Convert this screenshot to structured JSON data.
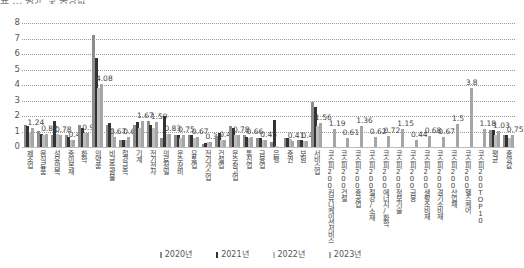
{
  "chart_data": {
    "type": "bar",
    "title": "",
    "xlabel": "",
    "ylabel": "",
    "ylim": [
      0,
      8
    ],
    "yticks": [
      0,
      1,
      2,
      3,
      4,
      5,
      6,
      7,
      8
    ],
    "grid": true,
    "legend_position": "bottom",
    "categories": [
      "제조업",
      "음식료품",
      "섬유의복",
      "종이목재",
      "화학",
      "의약품",
      "비금속광물",
      "철강금속",
      "기계",
      "전기전자",
      "의료정밀",
      "운수장비",
      "유통업",
      "전기가스업",
      "건설업",
      "운수창고업",
      "통신업",
      "금융업",
      "은행",
      "증권",
      "보험",
      "서비스업",
      "코스피200커뮤니케이션서비스",
      "코스피200건설",
      "코스피200중공업",
      "코스피200철강/소재",
      "코스피200에너지/화학",
      "코스피200정보기술",
      "코스피200금융",
      "코스피200생활소비재",
      "코스피200경기소비재",
      "코스피200산업재",
      "코스피200헬스케어",
      "코스피200TOP10",
      "평균",
      "중앙값"
    ],
    "series": [
      {
        "name": "2020년",
        "color": "#8c8c8c",
        "values": [
          1.45,
          1.05,
          0.75,
          0.75,
          1.45,
          7.2,
          1.45,
          0.45,
          1.45,
          1.7,
          0.6,
          0.75,
          0.75,
          0.2,
          0.7,
          1.35,
          0.75,
          0.6,
          0.3,
          0.6,
          0.45,
          2.9,
          null,
          null,
          null,
          null,
          null,
          null,
          null,
          null,
          null,
          null,
          null,
          null,
          1.1,
          0.75
        ]
      },
      {
        "name": "2021년",
        "color": "#333333",
        "values": [
          1.35,
          0.85,
          1.65,
          0.65,
          1.2,
          5.75,
          1.55,
          0.45,
          1.6,
          1.45,
          2.0,
          0.75,
          0.8,
          0.25,
          0.9,
          1.2,
          0.65,
          0.6,
          1.75,
          0.6,
          0.45,
          2.6,
          null,
          null,
          null,
          null,
          null,
          null,
          null,
          null,
          null,
          null,
          null,
          null,
          1.1,
          0.8
        ]
      },
      {
        "name": "2022년",
        "color": "#bdbdbd",
        "values": [
          0.9,
          0.8,
          0.85,
          0.45,
          0.9,
          3.8,
          1.25,
          0.45,
          1.25,
          1.2,
          0.85,
          0.55,
          0.55,
          0.3,
          0.45,
          0.8,
          0.6,
          0.45,
          0.05,
          0.5,
          0.4,
          1.35,
          null,
          null,
          null,
          null,
          null,
          null,
          null,
          null,
          null,
          null,
          null,
          null,
          0.8,
          0.6
        ]
      },
      {
        "name": "2023년",
        "color": "#a6a6a6",
        "values": [
          1.24,
          0.82,
          0.78,
          0.42,
          0.93,
          4.08,
          0.67,
          0.64,
          1.67,
          1.59,
          0.83,
          0.75,
          0.67,
          0.32,
          0.42,
          0.78,
          0.66,
          0.45,
          0.0,
          0.41,
          0.4,
          1.56,
          1.19,
          0.61,
          1.36,
          0.62,
          0.72,
          1.15,
          0.44,
          0.68,
          0.67,
          1.5,
          3.8,
          1.18,
          1.03,
          0.75
        ]
      }
    ],
    "data_labels": [
      "1.24",
      "0.82",
      "0.78",
      "0.42",
      "0.93",
      "4.08",
      "0.67",
      "0.64",
      "1.67",
      "1.59",
      "0.83",
      "0.75",
      "0.67",
      "0.32",
      "0.42",
      "0.78",
      "0.66",
      "0.45",
      "",
      "0.41",
      "0.4",
      "1.56",
      "1.19",
      "0.61",
      "1.36",
      "0.62",
      "0.72",
      "1.15",
      "0.44",
      "0.68",
      "0.67",
      "1.5",
      "3.8",
      "1.18",
      "1.03",
      "0.75"
    ]
  },
  "top_cut_text": "표 … 평균 및 중앙값"
}
